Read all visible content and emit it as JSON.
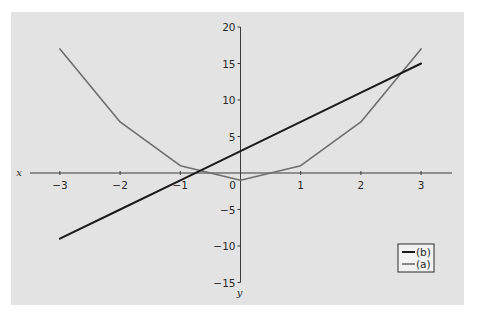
{
  "chart_data": {
    "type": "line",
    "title": "",
    "xlabel": "x",
    "ylabel": "y",
    "x": [
      -3,
      -2,
      -1,
      0,
      1,
      2,
      3
    ],
    "series": [
      {
        "name": "(b)",
        "values": [
          -9,
          -5,
          -1,
          3,
          7,
          11,
          15
        ],
        "color": "#1a1a1a",
        "width": 2
      },
      {
        "name": "(a)",
        "values": [
          17,
          7,
          1,
          -1,
          1,
          7,
          17
        ],
        "color": "#6e6e6e",
        "width": 1.6
      }
    ],
    "xlim": [
      -3.5,
      3.5
    ],
    "ylim": [
      -15,
      20
    ],
    "x_ticks": [
      -3,
      -2,
      -1,
      0,
      1,
      2,
      3
    ],
    "x_tick_labels": [
      "−3",
      "−2",
      "−1",
      "0",
      "1",
      "2",
      "3"
    ],
    "y_ticks": [
      20,
      15,
      10,
      5,
      -5,
      -10,
      -15
    ],
    "y_tick_labels": [
      "20",
      "15",
      "10",
      "5",
      "−5",
      "−10",
      "−15"
    ],
    "grid": false,
    "legend_position": "lower right",
    "legend": [
      "(b)",
      "(a)"
    ]
  },
  "colors": {
    "panel_background": "#e3e3e3",
    "axis": "#3a3a3a",
    "series_b": "#1a1a1a",
    "series_a": "#6e6e6e"
  }
}
